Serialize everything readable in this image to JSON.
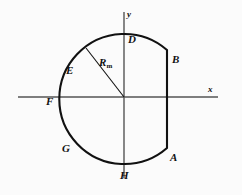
{
  "figure": {
    "background_color": "#fbfbfb",
    "axis_color": "#555555",
    "curve_color": "#111111",
    "label_color": "#111111",
    "axes": {
      "x_label": "x",
      "y_label": "y",
      "origin": {
        "x": 124,
        "y": 97
      },
      "x_range_px": [
        18,
        218
      ],
      "y_range_px": [
        12,
        178
      ]
    },
    "shape": {
      "type": "truncated-circle",
      "center": {
        "x": 124,
        "y": 97
      },
      "radius": 65,
      "chord_x": 167,
      "chord_top_y": 50,
      "chord_bottom_y": 148
    },
    "radius_line": {
      "label_base": "R",
      "label_sub": "m",
      "from": {
        "x": 124,
        "y": 97
      },
      "to": {
        "x": 86,
        "y": 48
      }
    },
    "points": [
      {
        "id": "A",
        "label": "A",
        "x": 170,
        "y": 152
      },
      {
        "id": "B",
        "label": "B",
        "x": 172,
        "y": 54
      },
      {
        "id": "D",
        "label": "D",
        "x": 128,
        "y": 34
      },
      {
        "id": "E",
        "label": "E",
        "x": 66,
        "y": 65
      },
      {
        "id": "F",
        "label": "F",
        "x": 46,
        "y": 96
      },
      {
        "id": "G",
        "label": "G",
        "x": 62,
        "y": 143
      },
      {
        "id": "H",
        "label": "H",
        "x": 120,
        "y": 170
      }
    ]
  }
}
